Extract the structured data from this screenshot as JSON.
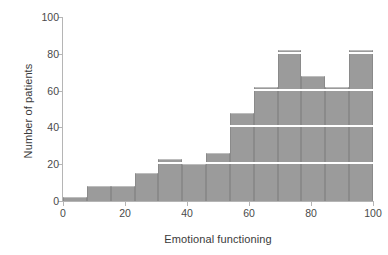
{
  "chart_data": {
    "type": "bar",
    "title": "",
    "xlabel": "Emotional functioning",
    "ylabel": "Number of patients",
    "xlim": [
      0,
      100
    ],
    "ylim": [
      0,
      100
    ],
    "xticks": [
      0,
      20,
      40,
      60,
      80,
      100
    ],
    "yticks": [
      0,
      20,
      40,
      60,
      80,
      100
    ],
    "xtick_labels": [
      "0",
      "20",
      "40",
      "60",
      "80",
      "100"
    ],
    "ytick_labels": [
      "0",
      "20",
      "40",
      "60",
      "80",
      "100"
    ],
    "grid": "horizontal-white-over-bars",
    "gridlines": [
      20,
      40,
      60,
      80
    ],
    "legend": null,
    "bin_width": 7.6923,
    "bin_edges": [
      0,
      7.69,
      15.38,
      23.08,
      30.77,
      38.46,
      46.15,
      53.85,
      61.54,
      69.23,
      76.92,
      84.62,
      92.31,
      100
    ],
    "categories": [
      "0-7.7",
      "7.7-15.4",
      "15.4-23.1",
      "23.1-30.8",
      "30.8-38.5",
      "38.5-46.2",
      "46.2-53.8",
      "53.8-61.5",
      "61.5-69.2",
      "69.2-76.9",
      "76.9-84.6",
      "84.6-92.3",
      "92.3-100"
    ],
    "values": [
      2,
      8,
      8,
      15,
      23,
      20,
      26,
      48,
      62,
      82,
      68,
      62,
      82
    ],
    "bar_color": "#9b9b9b",
    "bar_edge_color": "#8a8a8a",
    "axis_color": "#b5b5b5",
    "text_color": "#3a3a3a"
  }
}
